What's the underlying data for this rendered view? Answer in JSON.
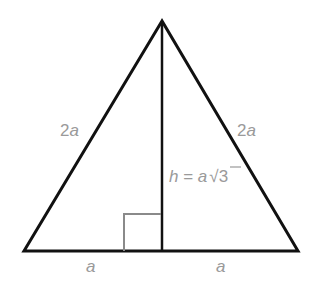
{
  "diagram": {
    "type": "equilateral-triangle-height",
    "colors": {
      "stroke": "#111111",
      "label": "#9a9a9a",
      "right_angle_marker": "#8a8a8a",
      "background": "#ffffff"
    },
    "vertices": {
      "apex": [
        162,
        21
      ],
      "bottom_left": [
        24,
        251
      ],
      "bottom_right": [
        298,
        251
      ],
      "foot": [
        162,
        251
      ]
    },
    "labels": {
      "left_side": {
        "coef": "2",
        "var": "a"
      },
      "right_side": {
        "coef": "2",
        "var": "a"
      },
      "height": {
        "var": "h",
        "eq": " = ",
        "a": "a",
        "root": "√",
        "radicand": "3"
      },
      "base_left": "a",
      "base_right": "a"
    }
  }
}
